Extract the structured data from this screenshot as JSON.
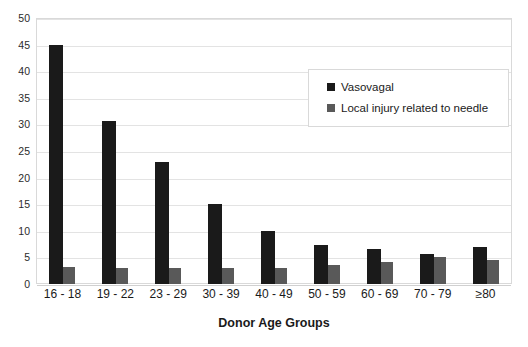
{
  "chart_data": {
    "type": "bar",
    "title": "",
    "xlabel": "Donor Age Groups",
    "ylabel": "",
    "categories": [
      "16 - 18",
      "19 - 22",
      "23 - 29",
      "30 - 39",
      "40 - 49",
      "50 - 59",
      "60 - 69",
      "70 - 79",
      "≥80"
    ],
    "series": [
      {
        "name": "Vasovagal",
        "color": "#1a1a1a",
        "values": [
          45.0,
          30.7,
          23.0,
          15.0,
          10.0,
          7.4,
          6.5,
          5.7,
          7.0
        ]
      },
      {
        "name": "Local injury related to needle",
        "color": "#595959",
        "values": [
          3.2,
          3.1,
          3.1,
          3.1,
          3.1,
          3.5,
          4.2,
          5.0,
          4.5
        ]
      }
    ],
    "ylim": [
      0,
      50
    ],
    "ytick_values": [
      0,
      5,
      10,
      15,
      20,
      25,
      30,
      35,
      40,
      45,
      50
    ],
    "ytick_labels": [
      "0",
      "5",
      "10",
      "15",
      "20",
      "25",
      "30",
      "35",
      "40",
      "45",
      "50"
    ],
    "grid": "horizontal",
    "legend_position": "upper-right-inside",
    "legend_entries": [
      "Vasovagal",
      "Local injury related to needle"
    ]
  }
}
